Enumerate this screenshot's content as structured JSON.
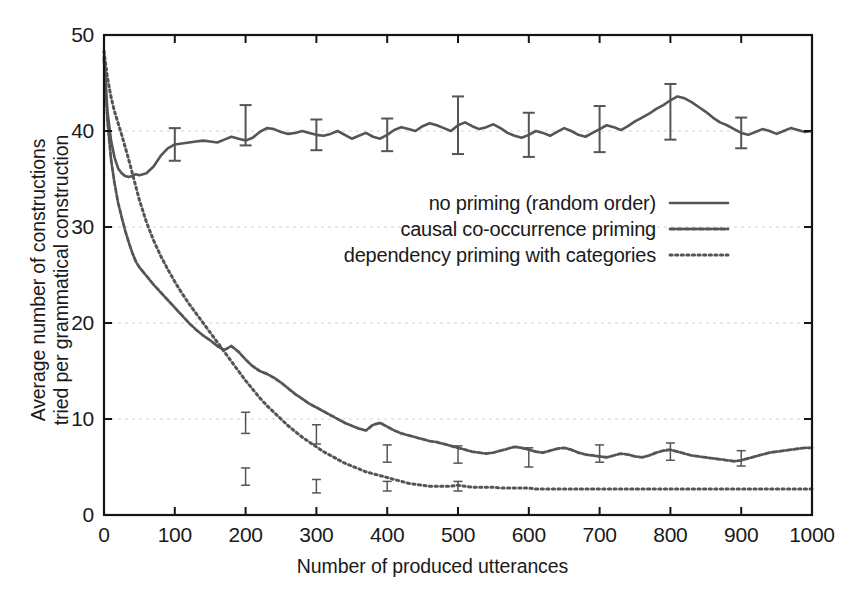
{
  "chart_data": {
    "type": "line",
    "title": "",
    "xlabel": "Number of produced utterances",
    "ylabel": "Average number of constructions tried per grammatical construction",
    "ylabel_line1": "Average number of constructions",
    "ylabel_line2": "tried per grammatical construction",
    "xlim": [
      0,
      1000
    ],
    "ylim": [
      0,
      50
    ],
    "xticks": [
      0,
      100,
      200,
      300,
      400,
      500,
      600,
      700,
      800,
      900,
      1000
    ],
    "yticks": [
      0,
      10,
      20,
      30,
      40,
      50
    ],
    "xticklabels": [
      "0",
      "100",
      "200",
      "300",
      "400",
      "500",
      "600",
      "700",
      "800",
      "900",
      "1000"
    ],
    "yticklabels": [
      "0",
      "10",
      "20",
      "30",
      "40",
      "50"
    ],
    "grid": "horizontal-dashed-faint",
    "legend_position": "center-right-inside",
    "line_color": "#555555",
    "series": [
      {
        "name": "no priming (random order)",
        "style": "solid",
        "x": [
          0,
          5,
          10,
          15,
          20,
          25,
          30,
          35,
          40,
          45,
          50,
          60,
          70,
          80,
          90,
          100,
          110,
          120,
          130,
          140,
          150,
          160,
          170,
          180,
          190,
          200,
          210,
          220,
          230,
          240,
          250,
          260,
          270,
          280,
          290,
          300,
          310,
          320,
          330,
          340,
          350,
          360,
          370,
          380,
          390,
          400,
          410,
          420,
          430,
          440,
          450,
          460,
          470,
          480,
          490,
          500,
          510,
          520,
          530,
          540,
          550,
          560,
          570,
          580,
          590,
          600,
          610,
          620,
          630,
          640,
          650,
          660,
          670,
          680,
          690,
          700,
          710,
          720,
          730,
          740,
          750,
          760,
          770,
          780,
          790,
          800,
          810,
          820,
          830,
          840,
          850,
          860,
          870,
          880,
          890,
          900,
          910,
          920,
          930,
          940,
          950,
          960,
          970,
          980,
          990,
          1000
        ],
        "y": [
          47.8,
          42.0,
          39.0,
          37.2,
          36.1,
          35.6,
          35.3,
          35.2,
          35.3,
          35.5,
          35.4,
          35.6,
          36.3,
          37.4,
          38.2,
          38.6,
          38.7,
          38.8,
          38.9,
          39.0,
          38.9,
          38.8,
          39.1,
          39.4,
          39.2,
          39.0,
          39.3,
          39.9,
          40.3,
          40.2,
          39.9,
          39.7,
          39.8,
          40.0,
          39.8,
          39.6,
          39.5,
          39.7,
          40.0,
          39.6,
          39.2,
          39.5,
          39.8,
          39.4,
          39.2,
          39.6,
          40.1,
          40.4,
          40.2,
          40.0,
          40.5,
          40.8,
          40.6,
          40.3,
          40.0,
          40.6,
          40.9,
          40.5,
          40.2,
          40.4,
          40.7,
          40.3,
          39.8,
          39.5,
          39.3,
          39.6,
          40.0,
          39.8,
          39.5,
          39.9,
          40.3,
          40.0,
          39.6,
          39.4,
          39.8,
          40.2,
          40.6,
          40.4,
          40.1,
          40.5,
          41.0,
          41.4,
          41.8,
          42.3,
          42.7,
          43.2,
          43.6,
          43.4,
          43.0,
          42.5,
          42.0,
          41.4,
          40.9,
          40.6,
          40.2,
          39.8,
          39.6,
          39.9,
          40.2,
          40.0,
          39.7,
          40.0,
          40.3,
          40.1,
          39.9,
          40.0
        ],
        "error_bars": [
          {
            "x": 200,
            "y": 40.6,
            "err": 2.1
          },
          {
            "x": 300,
            "y": 39.6,
            "err": 1.6
          },
          {
            "x": 400,
            "y": 39.6,
            "err": 1.7
          },
          {
            "x": 500,
            "y": 40.6,
            "err": 3.0
          },
          {
            "x": 600,
            "y": 39.6,
            "err": 2.3
          },
          {
            "x": 700,
            "y": 40.2,
            "err": 2.4
          },
          {
            "x": 800,
            "y": 42.0,
            "err": 2.9
          },
          {
            "x": 900,
            "y": 39.8,
            "err": 1.6
          },
          {
            "x": 100,
            "y": 38.6,
            "err": 1.7
          }
        ]
      },
      {
        "name": "causal co-occurrence priming",
        "style": "dashed",
        "x": [
          0,
          5,
          10,
          15,
          20,
          25,
          30,
          35,
          40,
          45,
          50,
          60,
          70,
          80,
          90,
          100,
          110,
          120,
          130,
          140,
          150,
          160,
          170,
          180,
          190,
          200,
          210,
          220,
          230,
          240,
          250,
          260,
          270,
          280,
          290,
          300,
          310,
          320,
          330,
          340,
          350,
          360,
          370,
          380,
          390,
          400,
          410,
          420,
          430,
          440,
          450,
          460,
          470,
          480,
          490,
          500,
          510,
          520,
          530,
          540,
          550,
          560,
          570,
          580,
          590,
          600,
          610,
          620,
          630,
          640,
          650,
          660,
          670,
          680,
          690,
          700,
          710,
          720,
          730,
          740,
          750,
          760,
          770,
          780,
          790,
          800,
          810,
          820,
          830,
          840,
          850,
          860,
          870,
          880,
          890,
          900,
          910,
          920,
          930,
          940,
          950,
          960,
          970,
          980,
          990,
          1000
        ],
        "y": [
          47.5,
          41.0,
          37.0,
          34.5,
          32.5,
          31.0,
          29.6,
          28.4,
          27.3,
          26.4,
          25.8,
          24.9,
          24.0,
          23.2,
          22.4,
          21.6,
          20.8,
          20.0,
          19.3,
          18.7,
          18.2,
          17.6,
          17.2,
          17.6,
          17.0,
          16.2,
          15.5,
          15.0,
          14.7,
          14.3,
          13.8,
          13.2,
          12.6,
          12.1,
          11.6,
          11.2,
          10.8,
          10.4,
          10.0,
          9.6,
          9.3,
          9.0,
          8.8,
          9.4,
          9.6,
          9.2,
          8.8,
          8.5,
          8.3,
          8.1,
          7.9,
          7.7,
          7.6,
          7.4,
          7.2,
          7.0,
          6.8,
          6.6,
          6.5,
          6.4,
          6.5,
          6.7,
          6.9,
          7.1,
          7.0,
          6.8,
          6.6,
          6.5,
          6.7,
          6.9,
          7.0,
          6.8,
          6.5,
          6.3,
          6.2,
          6.1,
          6.0,
          6.2,
          6.4,
          6.3,
          6.1,
          6.0,
          6.2,
          6.5,
          6.7,
          6.8,
          6.6,
          6.4,
          6.2,
          6.1,
          6.0,
          5.9,
          5.8,
          5.7,
          5.6,
          5.7,
          5.9,
          6.1,
          6.3,
          6.5,
          6.6,
          6.7,
          6.8,
          6.9,
          7.0,
          7.0
        ],
        "error_bars": [
          {
            "x": 200,
            "y": 9.6,
            "err": 1.1
          },
          {
            "x": 300,
            "y": 8.4,
            "err": 1.0
          },
          {
            "x": 400,
            "y": 6.4,
            "err": 0.9
          },
          {
            "x": 500,
            "y": 6.3,
            "err": 0.9
          },
          {
            "x": 600,
            "y": 6.0,
            "err": 1.0
          },
          {
            "x": 700,
            "y": 6.4,
            "err": 0.9
          },
          {
            "x": 800,
            "y": 6.6,
            "err": 0.9
          },
          {
            "x": 900,
            "y": 5.9,
            "err": 0.8
          }
        ]
      },
      {
        "name": "dependency priming with categories",
        "style": "dotted",
        "x": [
          0,
          5,
          10,
          15,
          20,
          25,
          30,
          35,
          40,
          45,
          50,
          60,
          70,
          80,
          90,
          100,
          110,
          120,
          130,
          140,
          150,
          160,
          170,
          180,
          190,
          200,
          210,
          220,
          230,
          240,
          250,
          260,
          270,
          280,
          290,
          300,
          310,
          320,
          330,
          340,
          350,
          360,
          370,
          380,
          390,
          400,
          410,
          420,
          430,
          440,
          450,
          460,
          470,
          480,
          490,
          500,
          510,
          520,
          530,
          540,
          550,
          560,
          570,
          580,
          590,
          600,
          610,
          620,
          630,
          640,
          650,
          660,
          670,
          680,
          690,
          700,
          710,
          720,
          730,
          740,
          750,
          760,
          770,
          780,
          790,
          800,
          810,
          820,
          830,
          840,
          850,
          860,
          870,
          880,
          890,
          900,
          910,
          920,
          930,
          940,
          950,
          960,
          970,
          980,
          990,
          1000
        ],
        "y": [
          48.3,
          45.5,
          43.5,
          42.0,
          40.8,
          39.6,
          38.3,
          37.0,
          35.6,
          34.2,
          32.8,
          30.5,
          28.6,
          27.0,
          25.6,
          24.3,
          23.1,
          22.0,
          21.0,
          20.0,
          19.0,
          18.0,
          17.0,
          16.0,
          15.0,
          14.0,
          13.1,
          12.2,
          11.4,
          10.7,
          10.0,
          9.3,
          8.7,
          8.1,
          7.6,
          7.1,
          6.6,
          6.2,
          5.8,
          5.4,
          5.1,
          4.8,
          4.5,
          4.3,
          4.1,
          3.9,
          3.7,
          3.5,
          3.3,
          3.2,
          3.1,
          3.0,
          3.0,
          3.0,
          3.0,
          3.1,
          3.0,
          2.9,
          2.9,
          2.9,
          2.9,
          2.8,
          2.8,
          2.8,
          2.8,
          2.8,
          2.7,
          2.7,
          2.7,
          2.7,
          2.7,
          2.7,
          2.7,
          2.7,
          2.7,
          2.7,
          2.7,
          2.7,
          2.7,
          2.7,
          2.7,
          2.7,
          2.7,
          2.7,
          2.7,
          2.7,
          2.7,
          2.7,
          2.7,
          2.7,
          2.7,
          2.7,
          2.7,
          2.7,
          2.7,
          2.7,
          2.7,
          2.7,
          2.7,
          2.7,
          2.7,
          2.7,
          2.7,
          2.7,
          2.7,
          2.7
        ],
        "error_bars": [
          {
            "x": 200,
            "y": 4.0,
            "err": 0.9
          },
          {
            "x": 300,
            "y": 3.0,
            "err": 0.7
          },
          {
            "x": 400,
            "y": 3.0,
            "err": 0.5
          },
          {
            "x": 500,
            "y": 3.0,
            "err": 0.5
          }
        ]
      }
    ]
  },
  "legend": {
    "items": [
      {
        "label": "no priming (random order)",
        "style": "solid"
      },
      {
        "label": "causal co-occurrence priming",
        "style": "dashed"
      },
      {
        "label": "dependency priming with categories",
        "style": "dotted"
      }
    ]
  }
}
